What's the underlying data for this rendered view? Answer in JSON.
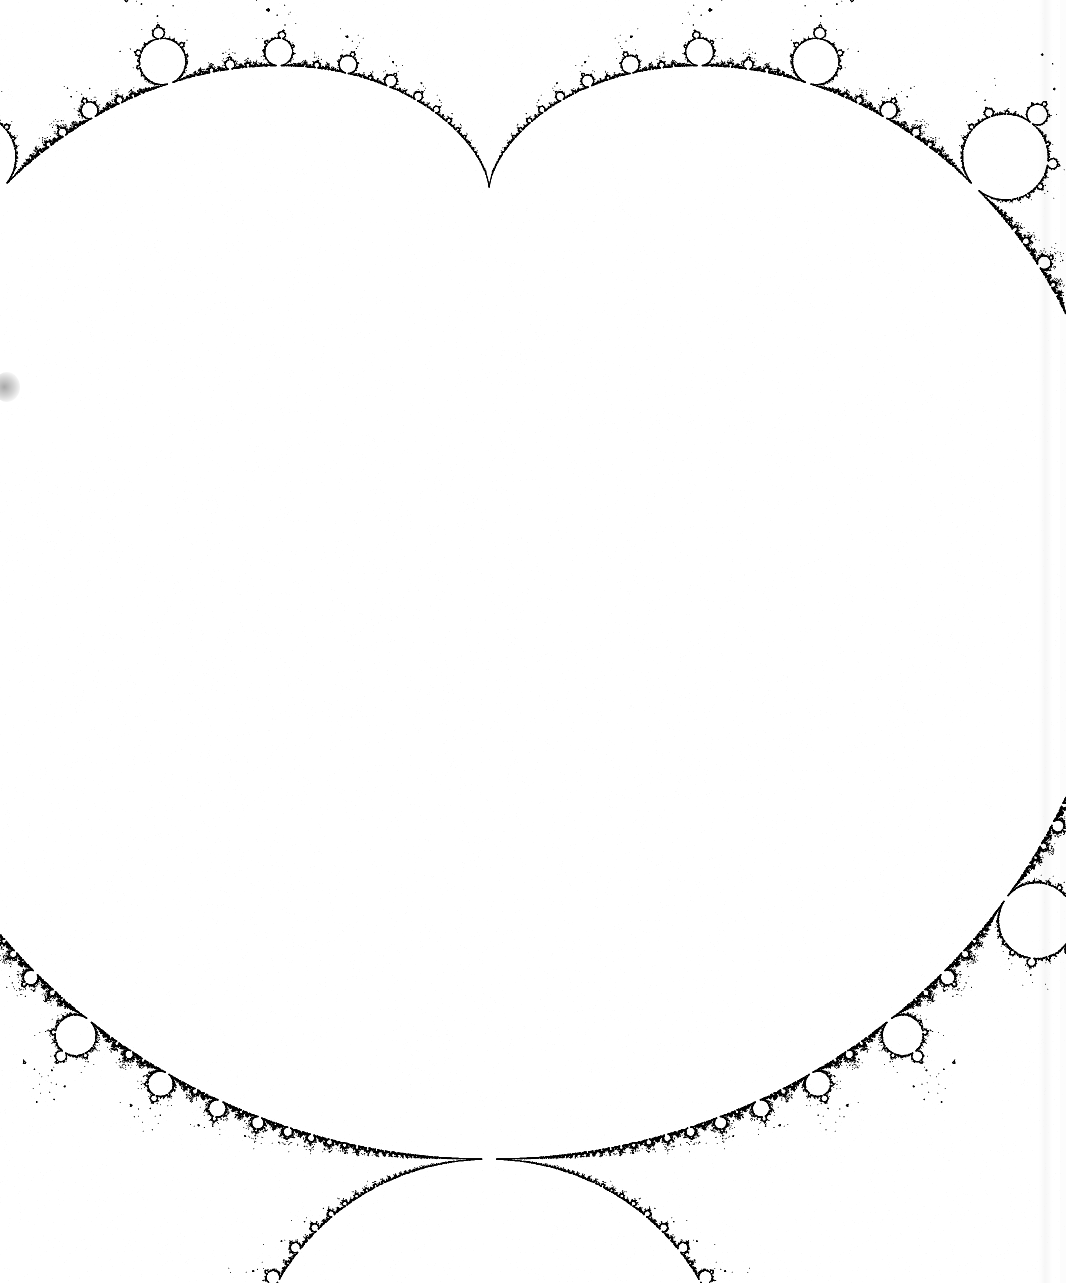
{
  "figure": {
    "render_style": "boundary-outline-black-on-white",
    "background_color": "#ffffff",
    "ink_color": "#000000",
    "orientation": "rotated-90-clockwise",
    "orientation_note": "real axis runs vertically downward; imaginary axis runs horizontally",
    "canvas": {
      "width": 1066,
      "height": 1283
    }
  },
  "chart_data": {
    "type": "scatter",
    "xlabel": "",
    "ylabel": "",
    "grid": false,
    "legend": null,
    "formula": "z_{n+1} = z_n^2 + c,  z_0 = 0",
    "set_definition": "c in C such that the orbit of 0 remains bounded",
    "max_iterations": 400,
    "escape_radius": 2,
    "complex_plane_window": {
      "re_min": -2.35,
      "re_max": 0.72,
      "im_min": -1.42,
      "im_max": 1.42
    },
    "screen_mapping": {
      "note": "image is the complex plane rotated 90 deg clockwise",
      "symmetry_axis_x_px": 489,
      "cardioid_cusp_px": {
        "x": 490,
        "y": 187
      },
      "cardioid_cusp_c": {
        "re": 0.25,
        "im": 0.0
      },
      "origin_px": {
        "x": 489,
        "y": 430
      },
      "origin_c": {
        "re": 0.0,
        "im": 0.0
      },
      "pixels_per_unit": 972,
      "real_axis_direction": "down",
      "imag_axis_direction": "right"
    },
    "features": [
      {
        "name": "main-cardioid",
        "period": 1,
        "shape": "cardioid",
        "center_c": {
          "re": 0.0,
          "im": 0.0
        },
        "cusp_px": {
          "x": 490,
          "y": 187
        },
        "widest_px": {
          "left_x": 150,
          "right_x": 840,
          "y": 430
        },
        "bottom_px": {
          "x": 489,
          "y": 652
        }
      },
      {
        "name": "period-2-disk",
        "period": 2,
        "shape": "disk",
        "center_c": {
          "re": -1.0,
          "im": 0.0
        },
        "radius_c": 0.25,
        "center_px": {
          "x": 489,
          "y": 768
        },
        "radius_px": 118,
        "tangent_px": {
          "x": 489,
          "y": 652
        }
      },
      {
        "name": "period-3-bulb-left",
        "period": 3,
        "shape": "disk",
        "center_c": {
          "re": -0.125,
          "im": 0.745
        },
        "center_px": {
          "x": 160,
          "y": 373
        },
        "radius_px": 46
      },
      {
        "name": "period-3-bulb-right",
        "period": 3,
        "shape": "disk",
        "center_c": {
          "re": -0.125,
          "im": -0.745
        },
        "center_px": {
          "x": 832,
          "y": 370
        },
        "radius_px": 44
      },
      {
        "name": "period-4-bulb-on-period-2-disk",
        "period": 4,
        "shape": "disk",
        "center_c": {
          "re": -1.31,
          "im": 0.0
        },
        "center_px": {
          "x": 489,
          "y": 908
        },
        "radius_px": 30
      },
      {
        "name": "period-4-bulb-left",
        "period": 4,
        "center_px": {
          "x": 255,
          "y": 540
        },
        "radius_px": 22
      },
      {
        "name": "period-4-bulb-right",
        "period": 4,
        "center_px": {
          "x": 744,
          "y": 538
        },
        "radius_px": 21
      },
      {
        "name": "period-5-bulb-upper-left",
        "period": 5,
        "center_px": {
          "x": 249,
          "y": 180
        },
        "radius_px": 19
      },
      {
        "name": "period-5-bulb-upper-right",
        "period": 5,
        "center_px": {
          "x": 733,
          "y": 178
        },
        "radius_px": 19
      },
      {
        "name": "antenna-spike",
        "description": "needle along the negative real axis running down the image",
        "from_px": {
          "x": 489,
          "y": 938
        },
        "to_px": {
          "x": 489,
          "y": 1205
        },
        "real_range_c": {
          "from": -1.4,
          "to": -2.0
        }
      },
      {
        "name": "period-3-mini-mandelbrot",
        "period": 3,
        "shape": "miniature-cardioid",
        "center_c": {
          "re": -1.7549,
          "im": 0.0
        },
        "center_px": {
          "x": 488,
          "y": 1112
        },
        "size_px": 19
      },
      {
        "name": "period-4-mini-mandelbrot",
        "period": 4,
        "center_c": {
          "re": -1.3107,
          "im": 0.0
        },
        "center_px": {
          "x": 489,
          "y": 1052
        },
        "size_px": 8
      },
      {
        "name": "left-antenna-tip",
        "tip_px": {
          "x": 14,
          "y": 386
        }
      },
      {
        "name": "right-antenna-tip",
        "tip_px": {
          "x": 992,
          "y": 388
        }
      }
    ],
    "bounding_box_px": {
      "x_min": 12,
      "y_min": 84,
      "x_max": 994,
      "y_max": 1208
    },
    "artifacts": [
      {
        "name": "scan-smudge",
        "position_px": {
          "x": 6,
          "y": 387
        },
        "color": "#8a8a8a"
      },
      {
        "name": "paper-edge-band",
        "position_px": {
          "x": 1046,
          "y": 0
        },
        "color": "#f0f0f0"
      }
    ]
  }
}
